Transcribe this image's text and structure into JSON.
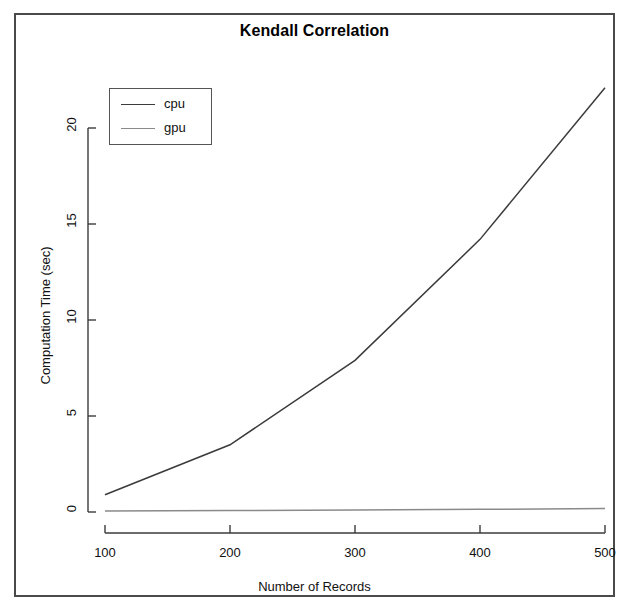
{
  "chart_data": {
    "type": "line",
    "title": "Kendall Correlation",
    "xlabel": "Number of Records",
    "ylabel": "Computation Time (sec)",
    "x": [
      100,
      200,
      300,
      400,
      500
    ],
    "xlim": [
      100,
      500
    ],
    "ylim": [
      0,
      22.5
    ],
    "xticks": [
      "100",
      "200",
      "300",
      "400",
      "500"
    ],
    "yticks": [
      "0",
      "5",
      "10",
      "15",
      "20"
    ],
    "grid": false,
    "legend_position": "top-left",
    "series": [
      {
        "name": "cpu",
        "color": "#3b3b3b",
        "values": [
          0.9,
          3.5,
          7.9,
          14.2,
          22.1
        ]
      },
      {
        "name": "gpu",
        "color": "#8a8a8a",
        "values": [
          0.05,
          0.08,
          0.1,
          0.14,
          0.18
        ]
      }
    ]
  },
  "legend": {
    "entries": [
      {
        "label": "cpu"
      },
      {
        "label": "gpu"
      }
    ]
  },
  "artifacts": {
    "ghost_left": "",
    "ghost_right": ""
  }
}
